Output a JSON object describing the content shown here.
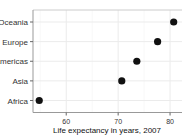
{
  "chart_data": {
    "type": "scatter",
    "title": "",
    "xlabel": "Life expectancy in years, 2007",
    "ylabel": "",
    "categories": [
      "Africa",
      "Asia",
      "Americas",
      "Europe",
      "Oceania"
    ],
    "values": [
      54.8,
      70.7,
      73.6,
      77.6,
      80.7
    ],
    "xticks": [
      60,
      70,
      80
    ],
    "xlim": [
      53.6,
      82.3
    ],
    "grid": true,
    "legend": null,
    "point_color": "#111111"
  }
}
